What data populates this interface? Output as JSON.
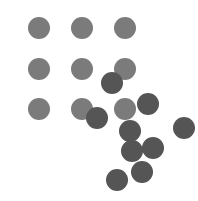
{
  "canvas": {
    "width": 198,
    "height": 201,
    "background": "#ffffff"
  },
  "colors": {
    "grid_dot": "#7b7b7b",
    "scatter_dot": "#555555"
  },
  "dot_radius": 11,
  "grid_dots": [
    {
      "x": 39,
      "y": 28
    },
    {
      "x": 82,
      "y": 28
    },
    {
      "x": 125,
      "y": 28
    },
    {
      "x": 39,
      "y": 69
    },
    {
      "x": 82,
      "y": 69
    },
    {
      "x": 125,
      "y": 69
    },
    {
      "x": 39,
      "y": 109
    },
    {
      "x": 82,
      "y": 109
    },
    {
      "x": 125,
      "y": 109
    }
  ],
  "scatter_dots": [
    {
      "x": 112,
      "y": 83
    },
    {
      "x": 97,
      "y": 118
    },
    {
      "x": 148,
      "y": 104
    },
    {
      "x": 130,
      "y": 131
    },
    {
      "x": 132,
      "y": 151
    },
    {
      "x": 153,
      "y": 148
    },
    {
      "x": 184,
      "y": 128
    },
    {
      "x": 142,
      "y": 172
    },
    {
      "x": 117,
      "y": 180
    }
  ]
}
